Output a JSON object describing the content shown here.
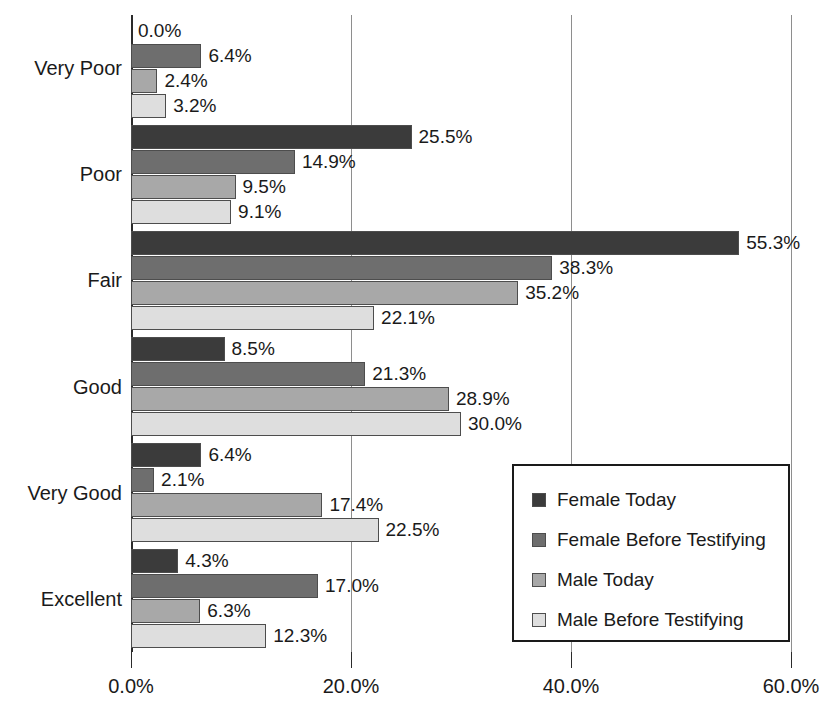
{
  "chart_data": {
    "type": "bar",
    "orientation": "horizontal",
    "title": "",
    "xlabel": "",
    "ylabel": "",
    "xlim": [
      0,
      60
    ],
    "xticks": [
      "0.0%",
      "20.0%",
      "40.0%",
      "60.0%"
    ],
    "xtick_values": [
      0,
      20,
      40,
      60
    ],
    "grid": true,
    "legend_position": "inside-right-lower",
    "categories": [
      "Very Poor",
      "Poor",
      "Fair",
      "Good",
      "Very Good",
      "Excellent"
    ],
    "series": [
      {
        "name": "Female Today",
        "color": "#3b3b3b",
        "values": [
          0.0,
          25.5,
          55.3,
          8.5,
          6.4,
          4.3
        ],
        "labels": [
          "0.0%",
          "25.5%",
          "55.3%",
          "8.5%",
          "6.4%",
          "4.3%"
        ]
      },
      {
        "name": "Female Before Testifying",
        "color": "#6e6e6e",
        "values": [
          6.4,
          14.9,
          38.3,
          21.3,
          2.1,
          17.0
        ],
        "labels": [
          "6.4%",
          "14.9%",
          "38.3%",
          "21.3%",
          "2.1%",
          "17.0%"
        ]
      },
      {
        "name": "Male Today",
        "color": "#a8a8a8",
        "values": [
          2.4,
          9.5,
          35.2,
          28.9,
          17.4,
          6.3
        ],
        "labels": [
          "2.4%",
          "9.5%",
          "35.2%",
          "28.9%",
          "17.4%",
          "6.3%"
        ]
      },
      {
        "name": "Male Before Testifying",
        "color": "#dedede",
        "values": [
          3.2,
          9.1,
          22.1,
          30.0,
          22.5,
          12.3
        ],
        "labels": [
          "3.2%",
          "9.1%",
          "22.1%",
          "30.0%",
          "22.5%",
          "12.3%"
        ]
      }
    ]
  },
  "legend": {
    "items": [
      {
        "label": "Female Today",
        "color": "#3b3b3b"
      },
      {
        "label": "Female Before Testifying",
        "color": "#6e6e6e"
      },
      {
        "label": "Male Today",
        "color": "#a8a8a8"
      },
      {
        "label": "Male Before Testifying",
        "color": "#dedede"
      }
    ]
  }
}
